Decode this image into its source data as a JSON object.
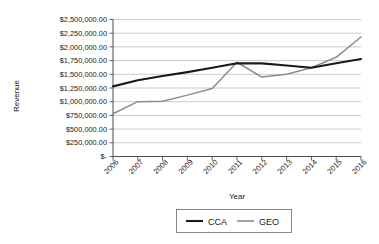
{
  "chart_data": {
    "type": "line",
    "title": "",
    "xlabel": "Year",
    "ylabel": "Revenue",
    "categories": [
      "2006",
      "2007",
      "2008",
      "2009",
      "2010",
      "2011",
      "2012",
      "2013",
      "2014",
      "2015",
      "2016"
    ],
    "ylim": [
      0,
      2500000
    ],
    "ytick_values": [
      0,
      250000,
      500000,
      750000,
      1000000,
      1250000,
      1500000,
      1750000,
      2000000,
      2250000,
      2500000
    ],
    "ytick_labels": [
      "$-",
      "$250,000.00",
      "$500,000.00",
      "$750,000.00",
      "$1,000,000.00",
      "$1,250,000.00",
      "$1,500,000.00",
      "$1,750,000.00",
      "$2,000,000.00",
      "$2,250,000.00",
      "$2,500,000.00"
    ],
    "grid": true,
    "legend_position": "bottom",
    "series": [
      {
        "name": "CCA",
        "color": "#1a1a1a",
        "values": [
          1280000,
          1390000,
          1470000,
          1540000,
          1620000,
          1700000,
          1700000,
          1660000,
          1620000,
          1700000,
          1780000
        ]
      },
      {
        "name": "GEO",
        "color": "#8c8c8c",
        "values": [
          780000,
          1000000,
          1010000,
          1120000,
          1240000,
          1720000,
          1450000,
          1500000,
          1620000,
          1810000,
          2180000
        ]
      }
    ]
  },
  "legend": {
    "items": [
      {
        "label": "CCA",
        "color": "#1a1a1a"
      },
      {
        "label": "GEO",
        "color": "#8c8c8c"
      }
    ]
  },
  "axes": {
    "x_title": "Year",
    "y_title": "Revenue"
  }
}
